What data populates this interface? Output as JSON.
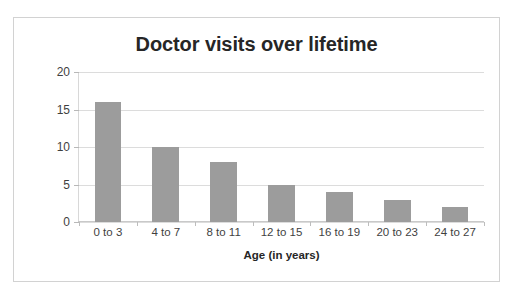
{
  "chart_data": {
    "type": "bar",
    "title": "Doctor visits over lifetime",
    "xlabel": "Age (in years)",
    "ylabel": "Total number of doctor visits",
    "categories": [
      "0 to 3",
      "4 to 7",
      "8 to 11",
      "12 to 15",
      "16 to 19",
      "20 to 23",
      "24 to 27"
    ],
    "values": [
      16,
      10,
      8,
      5,
      4,
      3,
      2
    ],
    "ylim": [
      0,
      20
    ],
    "ytick_labels": [
      "0",
      "5",
      "10",
      "15",
      "20"
    ],
    "ytick_values": [
      0,
      5,
      10,
      15,
      20
    ],
    "grid": true,
    "legend": "none",
    "bar_color": "#9c9c9c",
    "background_color": "#ffffff",
    "gridline_color": "#dcdcdc",
    "text_color": "#262626",
    "border_color": "#d2d2d2"
  }
}
